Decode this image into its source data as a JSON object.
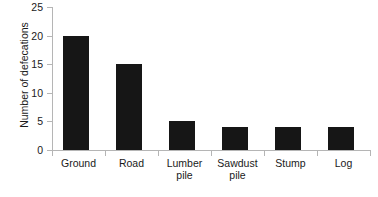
{
  "chart_data": {
    "type": "bar",
    "title": "",
    "subtitle": "",
    "xlabel": "",
    "ylabel": "Number of defecations",
    "categories": [
      "Ground",
      "Road",
      "Lumber\npile",
      "Sawdust\npile",
      "Stump",
      "Log"
    ],
    "values": [
      20,
      15,
      5,
      4,
      4,
      4
    ],
    "ylim": [
      0,
      25
    ],
    "y_ticks": [
      0,
      5,
      10,
      15,
      20,
      25
    ],
    "y_tick_labels": [
      "0",
      "5",
      "10",
      "15",
      "20",
      "25"
    ],
    "grid": false,
    "legend": false,
    "legend_position": "none",
    "bar_color": "#161616",
    "axis_color": "#b5b5b5",
    "background_color": "#ffffff",
    "text_color": "#1a1a1a"
  }
}
